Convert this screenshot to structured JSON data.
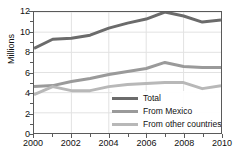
{
  "chart_data": {
    "type": "line",
    "title": "",
    "xlabel": "",
    "ylabel": "Millions",
    "xlim": [
      2000,
      2010
    ],
    "ylim": [
      0,
      12
    ],
    "grid": true,
    "legend_position": "lower-right-inside",
    "x": [
      2000,
      2001,
      2002,
      2003,
      2004,
      2005,
      2006,
      2007,
      2008,
      2009,
      2010
    ],
    "xtick_labels": [
      "2000",
      "2002",
      "2004",
      "2006",
      "2008",
      "2010"
    ],
    "xticks": [
      2000,
      2002,
      2004,
      2006,
      2008,
      2010
    ],
    "xticks_minor": [
      2001,
      2003,
      2005,
      2007,
      2009
    ],
    "ytick_labels": [
      "0",
      "2",
      "4",
      "6",
      "8",
      "10",
      "12"
    ],
    "yticks": [
      0,
      2,
      4,
      6,
      8,
      10,
      12
    ],
    "yticks_minor": [
      1,
      3,
      5,
      7,
      9,
      11
    ],
    "series": [
      {
        "name": "Total",
        "color": "#6b6b6b",
        "values": [
          8.4,
          9.3,
          9.4,
          9.7,
          10.4,
          10.9,
          11.3,
          12.0,
          11.6,
          11.0,
          11.2
        ]
      },
      {
        "name": "From Mexico",
        "color": "#9a9a9a",
        "values": [
          4.6,
          4.7,
          5.1,
          5.4,
          5.8,
          6.1,
          6.4,
          7.0,
          6.6,
          6.5,
          6.5
        ]
      },
      {
        "name": "From other countries",
        "color": "#b8b8b8",
        "values": [
          3.8,
          4.6,
          4.2,
          4.2,
          4.6,
          4.8,
          4.9,
          5.0,
          5.0,
          4.4,
          4.7
        ]
      }
    ]
  },
  "legend": {
    "items": [
      {
        "label": "Total",
        "color": "#6b6b6b"
      },
      {
        "label": "From Mexico",
        "color": "#9a9a9a"
      },
      {
        "label": "From other countries",
        "color": "#b8b8b8"
      }
    ]
  },
  "axes": {
    "y_title": "Millions",
    "frame_color": "#5a5a5a",
    "grid_color": "#e2e2e2"
  }
}
